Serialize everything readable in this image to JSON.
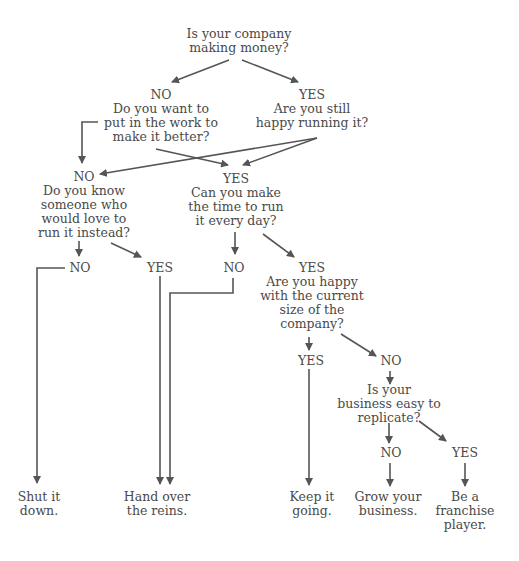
{
  "diagram": {
    "type": "flowchart",
    "line_color": "#555555",
    "text_color": "#4a4a4a",
    "nodes": {
      "q1": {
        "label": "",
        "lines": [
          "Is your company",
          "making money?"
        ]
      },
      "q2": {
        "label": "NO",
        "lines": [
          "Do you want to",
          "put in the work to",
          "make it better?"
        ]
      },
      "q3": {
        "label": "YES",
        "lines": [
          "Are you still",
          "happy running it?"
        ]
      },
      "q4": {
        "label": "NO",
        "lines": [
          "Do you know",
          "someone who",
          "would love to",
          "run it instead?"
        ]
      },
      "q5": {
        "label": "YES",
        "lines": [
          "Can you make",
          "the time to run",
          "it every day?"
        ]
      },
      "a_no_know": {
        "label": "NO"
      },
      "a_yes_know": {
        "label": "YES"
      },
      "a_no_time": {
        "label": "NO"
      },
      "q6": {
        "label": "YES",
        "lines": [
          "Are you happy",
          "with the current",
          "size of the",
          "company?"
        ]
      },
      "a_yes_size": {
        "label": "YES"
      },
      "a_no_size": {
        "label": "NO"
      },
      "q7": {
        "label": "",
        "lines": [
          "Is your",
          "business easy to",
          "replicate?"
        ]
      },
      "a_no_rep": {
        "label": "NO"
      },
      "a_yes_rep": {
        "label": "YES"
      }
    },
    "outcomes": {
      "shut": [
        "Shut it",
        "down."
      ],
      "hand": [
        "Hand over",
        "the reins."
      ],
      "keep": [
        "Keep it",
        "going."
      ],
      "grow": [
        "Grow your",
        "business."
      ],
      "franchise": [
        "Be a",
        "franchise",
        "player."
      ]
    }
  }
}
